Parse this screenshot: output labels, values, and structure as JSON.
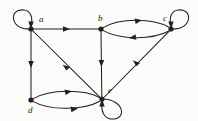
{
  "figure": {
    "background": "#fbfbfa",
    "ink": "#231f20",
    "width": 198,
    "height": 121
  },
  "graph": {
    "type": "directed-graph",
    "node_radius": 2.6,
    "nodes": [
      {
        "id": "a",
        "label": "a",
        "x": 31,
        "y": 29,
        "label_x": 39,
        "label_y": 22
      },
      {
        "id": "b",
        "label": "b",
        "x": 101,
        "y": 29,
        "label_x": 98,
        "label_y": 21
      },
      {
        "id": "c",
        "label": "c",
        "x": 171,
        "y": 29,
        "label_x": 163,
        "label_y": 21
      },
      {
        "id": "d",
        "label": "d",
        "x": 31,
        "y": 100,
        "label_x": 28,
        "label_y": 113
      },
      {
        "id": "e",
        "label": "e",
        "x": 102,
        "y": 99,
        "label_x": 108,
        "label_y": 93
      }
    ],
    "edges": [
      {
        "from": "a",
        "to": "a",
        "kind": "self-loop",
        "side": "left"
      },
      {
        "from": "c",
        "to": "c",
        "kind": "self-loop",
        "side": "right"
      },
      {
        "from": "e",
        "to": "e",
        "kind": "self-loop",
        "side": "bottom-right"
      },
      {
        "from": "a",
        "to": "b",
        "kind": "straight"
      },
      {
        "from": "a",
        "to": "d",
        "kind": "straight"
      },
      {
        "from": "a",
        "to": "e",
        "kind": "straight"
      },
      {
        "from": "b",
        "to": "e",
        "kind": "straight"
      },
      {
        "from": "b",
        "to": "c",
        "kind": "curve",
        "bow": "up"
      },
      {
        "from": "c",
        "to": "b",
        "kind": "curve",
        "bow": "down"
      },
      {
        "from": "d",
        "to": "e",
        "kind": "curve",
        "bow": "up"
      },
      {
        "from": "d",
        "to": "e",
        "kind": "curve",
        "bow": "down"
      },
      {
        "from": "e",
        "to": "c",
        "kind": "straight"
      }
    ]
  }
}
